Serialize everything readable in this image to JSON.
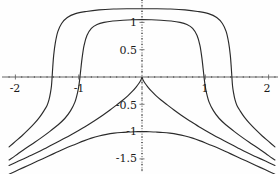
{
  "figure": {
    "background_color": "#fefefe",
    "curve_color": "#2b2b2b",
    "axis_color": "#555555",
    "label_color": "#1a1a1a"
  },
  "axes": {
    "x_axis_name": "horizontal-axis",
    "y_axis_name": "vertical-axis",
    "x_tick_labels": [
      "-2",
      "-1",
      "1",
      "2"
    ],
    "x_tick_values": [
      -2,
      -1,
      1,
      2
    ],
    "y_tick_labels": [
      "1",
      "0.5",
      "-0.5",
      "-1",
      "-1.5"
    ],
    "y_tick_values": [
      1,
      0.5,
      -0.5,
      -1,
      -1.5
    ]
  },
  "chart_data": {
    "type": "line",
    "title": "",
    "xlabel": "",
    "ylabel": "",
    "xlim": [
      -2.15,
      2.15
    ],
    "ylim": [
      -1.8,
      1.42
    ],
    "grid": false,
    "legend": null,
    "xticks": [
      -2,
      -1,
      1,
      2
    ],
    "yticks": [
      1,
      0.5,
      -0.5,
      -1,
      -1.5
    ],
    "xtick_labels": [
      "-2",
      "-1",
      "1",
      "2"
    ],
    "ytick_labels": [
      "1",
      "0.5",
      "-0.5",
      "-1",
      "-1.5"
    ],
    "axis_style": "centered-cross-with-arrowless-ends",
    "series": [
      {
        "name": "curve-1-outer-plateau",
        "plateau_y": 1.25,
        "x_axis_crossings": [
          -1.42,
          1.42
        ],
        "x": [
          -2.1,
          -2.0,
          -1.9,
          -1.8,
          -1.7,
          -1.62,
          -1.55,
          -1.5,
          -1.47,
          -1.445,
          -1.43,
          -1.42,
          -1.41,
          -1.395,
          -1.37,
          -1.33,
          -1.27,
          -1.18,
          -1.05,
          -0.88,
          -0.68,
          -0.45,
          -0.22,
          0.0,
          0.22,
          0.45,
          0.68,
          0.88,
          1.05,
          1.18,
          1.27,
          1.33,
          1.37,
          1.395,
          1.41,
          1.42,
          1.43,
          1.445,
          1.47,
          1.5,
          1.55,
          1.62,
          1.7,
          1.8,
          1.9,
          2.0,
          2.1
        ],
        "y": [
          -1.28,
          -1.18,
          -1.08,
          -0.97,
          -0.85,
          -0.74,
          -0.62,
          -0.52,
          -0.42,
          -0.28,
          -0.16,
          0.0,
          0.18,
          0.4,
          0.62,
          0.83,
          0.98,
          1.09,
          1.16,
          1.2,
          1.23,
          1.245,
          1.25,
          1.25,
          1.25,
          1.245,
          1.23,
          1.2,
          1.16,
          1.09,
          0.98,
          0.83,
          0.62,
          0.4,
          0.18,
          0.0,
          -0.16,
          -0.28,
          -0.42,
          -0.52,
          -0.62,
          -0.74,
          -0.85,
          -0.97,
          -1.08,
          -1.18,
          -1.28
        ]
      },
      {
        "name": "curve-2-inner-plateau",
        "plateau_y": 1.05,
        "x_axis_crossings": [
          -0.98,
          0.98
        ],
        "x": [
          -2.1,
          -2.0,
          -1.88,
          -1.74,
          -1.6,
          -1.46,
          -1.33,
          -1.22,
          -1.13,
          -1.06,
          -1.015,
          -0.995,
          -0.98,
          -0.965,
          -0.945,
          -0.915,
          -0.87,
          -0.8,
          -0.71,
          -0.6,
          -0.46,
          -0.3,
          -0.15,
          0.0,
          0.15,
          0.3,
          0.46,
          0.6,
          0.71,
          0.8,
          0.87,
          0.915,
          0.945,
          0.965,
          0.98,
          0.995,
          1.015,
          1.06,
          1.13,
          1.22,
          1.33,
          1.46,
          1.6,
          1.74,
          1.88,
          2.0,
          2.1
        ],
        "y": [
          -1.52,
          -1.44,
          -1.34,
          -1.23,
          -1.12,
          -1.0,
          -0.88,
          -0.76,
          -0.62,
          -0.46,
          -0.27,
          -0.14,
          0.0,
          0.16,
          0.36,
          0.58,
          0.76,
          0.89,
          0.96,
          1.0,
          1.025,
          1.04,
          1.048,
          1.05,
          1.048,
          1.04,
          1.025,
          1.0,
          0.96,
          0.89,
          0.76,
          0.58,
          0.36,
          0.16,
          0.0,
          -0.14,
          -0.27,
          -0.46,
          -0.62,
          -0.76,
          -0.88,
          -1.0,
          -1.12,
          -1.23,
          -1.34,
          -1.44,
          -1.52
        ]
      },
      {
        "name": "curve-3-cusp-at-origin",
        "cusp_point": [
          0,
          0
        ],
        "x": [
          -2.1,
          -1.95,
          -1.8,
          -1.65,
          -1.5,
          -1.35,
          -1.2,
          -1.05,
          -0.9,
          -0.75,
          -0.62,
          -0.5,
          -0.4,
          -0.3,
          -0.22,
          -0.15,
          -0.09,
          -0.045,
          -0.015,
          0.0,
          0.015,
          0.045,
          0.09,
          0.15,
          0.22,
          0.3,
          0.4,
          0.5,
          0.62,
          0.75,
          0.9,
          1.05,
          1.2,
          1.35,
          1.5,
          1.65,
          1.8,
          1.95,
          2.1
        ],
        "y": [
          -1.62,
          -1.54,
          -1.46,
          -1.38,
          -1.29,
          -1.2,
          -1.11,
          -1.01,
          -0.91,
          -0.8,
          -0.7,
          -0.6,
          -0.51,
          -0.42,
          -0.34,
          -0.26,
          -0.18,
          -0.11,
          -0.05,
          0.0,
          -0.05,
          -0.11,
          -0.18,
          -0.26,
          -0.34,
          -0.42,
          -0.51,
          -0.6,
          -0.7,
          -0.8,
          -0.91,
          -1.01,
          -1.11,
          -1.2,
          -1.29,
          -1.38,
          -1.46,
          -1.54,
          -1.62
        ]
      },
      {
        "name": "curve-4-peak-at-minus-one",
        "peak_point": [
          0,
          -1
        ],
        "x": [
          -2.1,
          -1.95,
          -1.8,
          -1.65,
          -1.5,
          -1.35,
          -1.2,
          -1.05,
          -0.92,
          -0.8,
          -0.68,
          -0.56,
          -0.44,
          -0.33,
          -0.22,
          -0.12,
          -0.05,
          0.0,
          0.05,
          0.12,
          0.22,
          0.33,
          0.44,
          0.56,
          0.68,
          0.8,
          0.92,
          1.05,
          1.2,
          1.35,
          1.5,
          1.65,
          1.8,
          1.95,
          2.1
        ],
        "y": [
          -1.78,
          -1.7,
          -1.62,
          -1.54,
          -1.46,
          -1.38,
          -1.3,
          -1.23,
          -1.17,
          -1.12,
          -1.08,
          -1.05,
          -1.029,
          -1.016,
          -1.008,
          -1.003,
          -1.001,
          -1.0,
          -1.001,
          -1.003,
          -1.008,
          -1.016,
          -1.029,
          -1.05,
          -1.08,
          -1.12,
          -1.17,
          -1.23,
          -1.3,
          -1.38,
          -1.46,
          -1.54,
          -1.62,
          -1.7,
          -1.78
        ]
      }
    ]
  }
}
